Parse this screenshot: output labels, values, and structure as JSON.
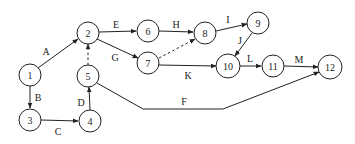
{
  "diagram": {
    "type": "activity-on-arrow network",
    "nodes": [
      {
        "id": "1",
        "label": "1",
        "x": 30,
        "y": 75
      },
      {
        "id": "2",
        "label": "2",
        "x": 88,
        "y": 33
      },
      {
        "id": "3",
        "label": "3",
        "x": 30,
        "y": 120
      },
      {
        "id": "4",
        "label": "4",
        "x": 90,
        "y": 121
      },
      {
        "id": "5",
        "label": "5",
        "x": 88,
        "y": 76
      },
      {
        "id": "6",
        "label": "6",
        "x": 148,
        "y": 31
      },
      {
        "id": "7",
        "label": "7",
        "x": 148,
        "y": 63
      },
      {
        "id": "8",
        "label": "8",
        "x": 205,
        "y": 33
      },
      {
        "id": "9",
        "label": "9",
        "x": 258,
        "y": 23
      },
      {
        "id": "10",
        "label": "10",
        "x": 228,
        "y": 66
      },
      {
        "id": "11",
        "label": "11",
        "x": 273,
        "y": 66
      },
      {
        "id": "12",
        "label": "12",
        "x": 330,
        "y": 67
      }
    ],
    "edges": [
      {
        "from": "1",
        "to": "2",
        "label": "A",
        "style": "solid"
      },
      {
        "from": "1",
        "to": "3",
        "label": "B",
        "style": "solid"
      },
      {
        "from": "3",
        "to": "4",
        "label": "C",
        "style": "solid"
      },
      {
        "from": "4",
        "to": "5",
        "label": "D",
        "style": "solid"
      },
      {
        "from": "5",
        "to": "2",
        "label": "",
        "style": "dashed"
      },
      {
        "from": "2",
        "to": "6",
        "label": "E",
        "style": "solid"
      },
      {
        "from": "2",
        "to": "7",
        "label": "G",
        "style": "solid"
      },
      {
        "from": "6",
        "to": "8",
        "label": "H",
        "style": "solid"
      },
      {
        "from": "7",
        "to": "8",
        "label": "",
        "style": "dashed"
      },
      {
        "from": "8",
        "to": "9",
        "label": "I",
        "style": "solid"
      },
      {
        "from": "9",
        "to": "10",
        "label": "J",
        "style": "solid"
      },
      {
        "from": "7",
        "to": "10",
        "label": "K",
        "style": "solid"
      },
      {
        "from": "10",
        "to": "11",
        "label": "L",
        "style": "solid"
      },
      {
        "from": "11",
        "to": "12",
        "label": "M",
        "style": "solid"
      },
      {
        "from": "5",
        "to": "12",
        "label": "F",
        "style": "solid",
        "via": [
          [
            143,
            109
          ],
          [
            223,
            109
          ]
        ]
      }
    ]
  },
  "labels": {
    "A": "A",
    "B": "B",
    "C": "C",
    "D": "D",
    "E": "E",
    "F": "F",
    "G": "G",
    "H": "H",
    "I": "I",
    "J": "J",
    "K": "K",
    "L": "L",
    "M": "M"
  },
  "node_labels": {
    "n1": "1",
    "n2": "2",
    "n3": "3",
    "n4": "4",
    "n5": "5",
    "n6": "6",
    "n7": "7",
    "n8": "8",
    "n9": "9",
    "n10": "10",
    "n11": "11",
    "n12": "12"
  }
}
